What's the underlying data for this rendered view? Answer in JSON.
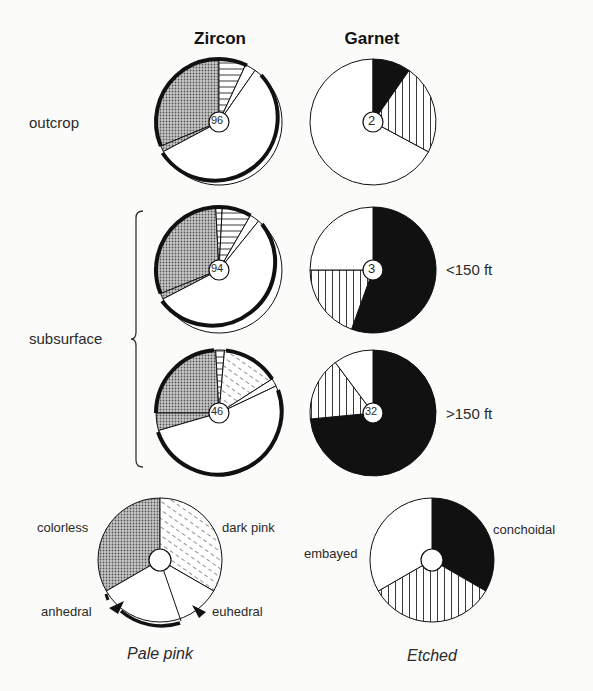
{
  "headers": {
    "zircon": "Zircon",
    "garnet": "Garnet"
  },
  "rows": {
    "outcrop": "outcrop",
    "subsurface": "subsurface",
    "shallow": "<150 ft",
    "deep": ">150 ft"
  },
  "pies": {
    "zircon_outcrop": {
      "count": "96"
    },
    "garnet_outcrop": {
      "count": "2"
    },
    "zircon_shallow": {
      "count": "94"
    },
    "garnet_shallow": {
      "count": "3"
    },
    "zircon_deep": {
      "count": "46"
    },
    "garnet_deep": {
      "count": "32"
    }
  },
  "legend": {
    "zircon": {
      "title": "Pale pink",
      "colorless": "colorless",
      "dark_pink": "dark pink",
      "anhedral": "anhedral",
      "euhedral": "euhedral"
    },
    "garnet": {
      "title": "Etched",
      "embayed": "embayed",
      "conchoidal": "conchoidal"
    }
  },
  "colors": {
    "ink": "#111111",
    "dots": "#9a9a9a",
    "paper": "#fbfbf9"
  }
}
